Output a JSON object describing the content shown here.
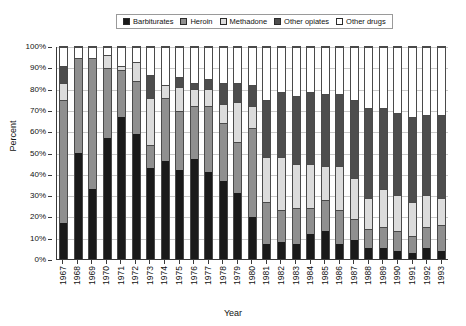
{
  "chart": {
    "type": "bar",
    "title": "",
    "xlabel": "Year",
    "ylabel": "Percent"
  },
  "legend": {
    "position": "top",
    "items": [
      {
        "label": "Barbiturates",
        "color": "#1a1a1a"
      },
      {
        "label": "Heroin",
        "color": "#8f8f8f"
      },
      {
        "label": "Methadone",
        "color": "#dcdcdc"
      },
      {
        "label": "Other opiates",
        "color": "#4d4d4d"
      },
      {
        "label": "Other drugs",
        "color": "#ffffff"
      }
    ]
  },
  "yaxis": {
    "ticks": [
      "0%",
      "10%",
      "20%",
      "30%",
      "40%",
      "50%",
      "60%",
      "70%",
      "80%",
      "90%",
      "100%"
    ],
    "min": 0,
    "max": 100
  },
  "chart_data": {
    "type": "bar",
    "stacked": true,
    "title": "",
    "xlabel": "Year",
    "ylabel": "Percent",
    "ylim": [
      0,
      100
    ],
    "grid": true,
    "legend_position": "top",
    "categories": [
      "1967",
      "1968",
      "1969",
      "1970",
      "1971",
      "1972",
      "1973",
      "1974",
      "1975",
      "1976",
      "1977",
      "1978",
      "1979",
      "1980",
      "1981",
      "1982",
      "1983",
      "1984",
      "1985",
      "1986",
      "1987",
      "1988",
      "1989",
      "1990",
      "1991",
      "1992",
      "1993"
    ],
    "series": [
      {
        "name": "Barbiturates",
        "color": "#1a1a1a",
        "values": [
          17,
          50,
          33,
          57,
          67,
          59,
          43,
          46,
          42,
          47,
          41,
          37,
          31,
          20,
          7,
          8,
          7,
          12,
          13,
          7,
          9,
          5,
          5,
          4,
          3,
          5,
          4
        ]
      },
      {
        "name": "Heroin",
        "color": "#8f8f8f",
        "values": [
          58,
          45,
          62,
          33,
          22,
          25,
          11,
          30,
          28,
          25,
          31,
          27,
          24,
          42,
          20,
          15,
          17,
          12,
          15,
          16,
          10,
          9,
          10,
          9,
          8,
          10,
          12
        ]
      },
      {
        "name": "Methadone",
        "color": "#dcdcdc",
        "values": [
          8,
          0,
          0,
          6,
          2,
          9,
          22,
          6,
          11,
          8,
          8,
          9,
          19,
          10,
          21,
          25,
          21,
          21,
          16,
          21,
          19,
          15,
          18,
          17,
          16,
          15,
          13
        ]
      },
      {
        "name": "Other opiates",
        "color": "#4d4d4d",
        "values": [
          8,
          0,
          0,
          0,
          0,
          0,
          11,
          0,
          5,
          3,
          5,
          10,
          9,
          10,
          27,
          31,
          32,
          34,
          34,
          34,
          37,
          42,
          38,
          39,
          40,
          38,
          39
        ]
      },
      {
        "name": "Other drugs",
        "color": "#ffffff",
        "values": [
          9,
          5,
          5,
          4,
          9,
          7,
          13,
          18,
          14,
          17,
          15,
          17,
          17,
          18,
          25,
          21,
          23,
          21,
          22,
          22,
          25,
          29,
          29,
          31,
          33,
          32,
          32
        ]
      }
    ]
  }
}
